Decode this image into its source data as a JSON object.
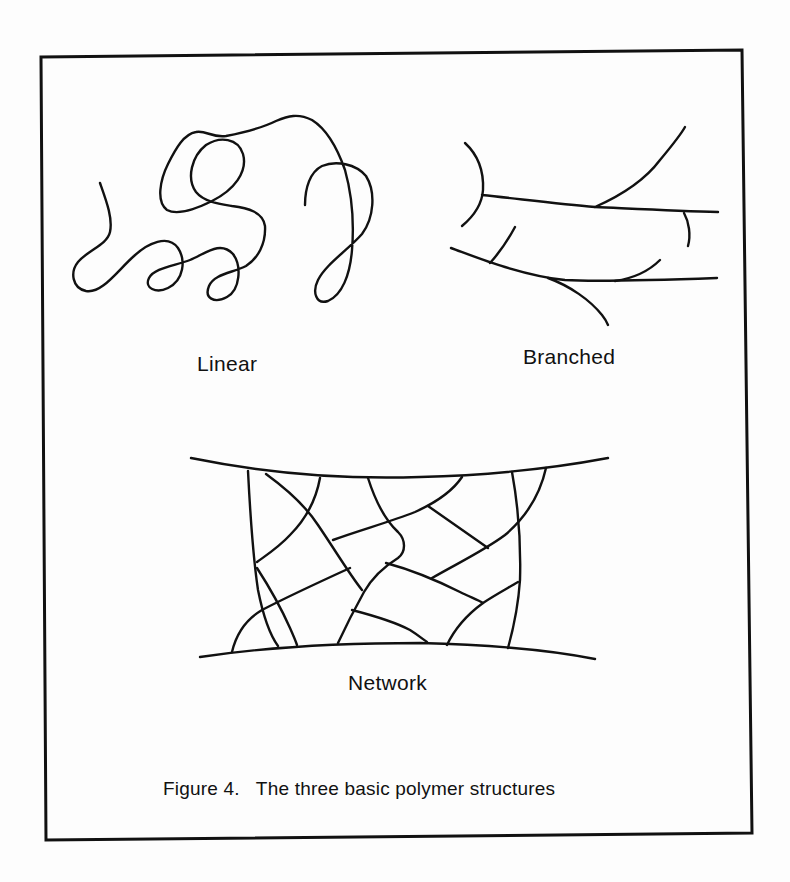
{
  "figure": {
    "caption": "Figure 4.   The three basic polymer structures",
    "frame": {
      "points": "41,57 742,50 752,833 46,840"
    },
    "panels": [
      {
        "id": "linear",
        "label": "Linear",
        "label_pos": {
          "left": 197,
          "top": 352
        },
        "paths": [
          "M100,183 C106,200 113,218 110,232 C107,245 88,250 78,262 C70,272 72,288 86,291 C102,294 118,270 134,256 C148,243 168,234 178,248 C186,260 184,280 168,288 C156,294 144,288 149,278 C154,268 174,266 190,260 C205,254 220,240 233,254 C242,266 240,290 227,297 C214,304 204,298 209,286 C214,274 232,273 246,266 C258,258 266,244 265,226 C263,212 248,208 232,206 C220,204 204,202 196,192 C186,178 192,156 206,145 C220,136 238,138 243,154 C248,172 234,190 212,201 C196,209 178,216 167,210 C156,202 160,180 168,164 C176,148 184,134 196,132 C206,130 212,138 226,136 C246,132 262,128 276,121 C288,116 298,113 312,120 C328,130 338,150 345,170 C352,195 354,225 352,250 C350,275 342,295 328,301 C316,305 312,292 318,280 C326,264 348,250 362,234 C374,218 376,192 366,176 C356,164 336,160 322,166 C310,172 305,188 305,205"
        ]
      },
      {
        "id": "branched",
        "label": "Branched",
        "label_pos": {
          "left": 523,
          "top": 345
        },
        "paths": [
          "M465,143 C478,155 484,170 483,190 C482,205 474,216 462,226",
          "M482,195 C520,199 560,204 595,207 C640,209 680,211 718,212",
          "M595,207 C620,196 645,180 660,160 C670,148 680,136 685,127",
          "M684,213 C689,222 691,235 688,246",
          "M451,248 C470,255 488,262 505,267 C525,273 545,278 565,280 C600,282 660,280 717,278",
          "M490,263 C500,252 508,240 515,227",
          "M615,281 C635,278 650,270 660,260",
          "M548,278 C570,286 590,300 602,315 C606,320 608,325 608,325"
        ]
      },
      {
        "id": "network",
        "label": "Network",
        "label_pos": {
          "left": 348,
          "top": 671
        },
        "paths": [
          "M191,458 C250,470 330,480 420,477 C500,475 560,467 608,458",
          "M200,657 C260,648 340,643 420,643 C500,645 560,652 595,659",
          "M248,471 C250,510 252,550 258,590 C263,615 270,635 278,646",
          "M266,474 C288,490 305,505 318,525 C335,550 350,575 362,590",
          "M320,478 C316,500 305,520 290,535 C278,548 265,556 257,562",
          "M368,478 C375,500 385,520 398,532 C406,540 406,552 398,558 C385,566 372,578 364,592 C354,610 345,628 338,643",
          "M333,540 C360,530 390,522 415,512 C435,503 452,492 462,477",
          "M428,506 C445,518 462,530 488,548",
          "M546,468 C540,495 525,518 505,535 C485,550 460,562 432,578",
          "M512,472 C518,505 521,545 520,580 C518,610 513,630 508,648",
          "M386,563 C412,570 440,582 460,592 C470,597 478,600 483,603",
          "M447,645 C455,628 468,614 483,603 C495,595 508,588 518,582",
          "M352,610 C375,616 395,622 410,630 C418,635 424,640 427,642",
          "M232,652 C236,635 245,620 262,610 C285,598 315,584 350,568",
          "M257,568 C268,585 282,610 290,628 C294,637 296,642 297,645"
        ]
      }
    ],
    "caption_pos": {
      "left": 163,
      "top": 778
    },
    "colors": {
      "ink": "#111111",
      "paper": "#fdfdfd"
    }
  }
}
